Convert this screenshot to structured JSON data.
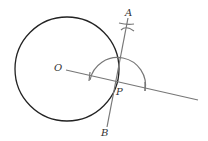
{
  "diagram": {
    "type": "geometric-construction",
    "labels": {
      "O": "O",
      "P": "P",
      "A": "A",
      "B": "B"
    },
    "colors": {
      "circle": "#222222",
      "construction": "#777777",
      "label": "#333333",
      "background": "#ffffff"
    },
    "circle": {
      "cx": 67,
      "cy": 69,
      "r": 52
    },
    "points": {
      "O": {
        "x": 66,
        "y": 70
      },
      "P": {
        "x": 117,
        "y": 82
      },
      "A": {
        "x": 128,
        "y": 22
      },
      "B": {
        "x": 107,
        "y": 126
      }
    },
    "lines": [
      {
        "name": "ray-OP-extended",
        "from": [
          66,
          70
        ],
        "to": [
          198,
          100
        ]
      },
      {
        "name": "tangent-AB",
        "from": [
          128,
          18
        ],
        "to": [
          107,
          127
        ]
      }
    ],
    "arcs": [
      {
        "name": "semicircle-arc-at-P",
        "cx": 117,
        "cy": 83,
        "r": 28
      }
    ]
  }
}
